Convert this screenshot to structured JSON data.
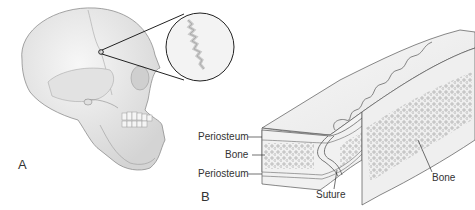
{
  "figure": {
    "panels": [
      {
        "id": "A",
        "label": "A",
        "subject": "skull-lateral-view-with-magnified-suture"
      },
      {
        "id": "B",
        "label": "B",
        "subject": "suture-cross-section"
      }
    ],
    "labels": {
      "periosteum_top": "Periosteum",
      "bone_left": "Bone",
      "periosteum_bottom": "Periosteum",
      "suture": "Suture",
      "bone_right": "Bone"
    },
    "colors": {
      "bone_fill": "#ececec",
      "line": "#444444",
      "texture": "#9a9a9a"
    }
  }
}
